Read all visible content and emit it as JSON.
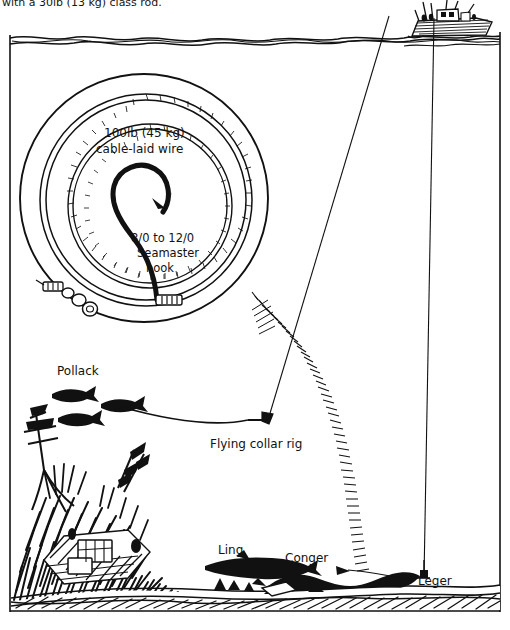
{
  "figure": {
    "domain": "Diagram",
    "title_fragment": "with a 30lb (13 kg) class rod.",
    "background_color": "#ffffff",
    "ink_color": "#111111",
    "width": 510,
    "height": 630
  },
  "inset": {
    "name": "coiled wire trace",
    "wire_label_line1": "100lb (45 kg)",
    "wire_label_line2": "cable-laid wire",
    "hook_label_line1": "8/0 to 12/0",
    "hook_label_line2": "Seamaster",
    "hook_label_line3": "hook",
    "components": [
      "outer-circle",
      "coiled-wire-spiral",
      "large-hook",
      "crimp-sleeve",
      "swivel-and-link"
    ]
  },
  "labels": {
    "pollack": "Pollack",
    "flying_collar_rig": "Flying collar rig",
    "ling": "Ling",
    "conger": "Conger",
    "leger": "Leger"
  },
  "scene": {
    "boat": "fishing-boat",
    "water_surface": "sea-surface-line",
    "seabed": "seabed",
    "wreck": "shipwreck",
    "kelp": "kelp-and-weed",
    "lines": [
      {
        "name": "flying-collar-line",
        "from": "boat",
        "to": "flying-collar-rig"
      },
      {
        "name": "leger-line",
        "from": "boat",
        "to": "leger-weight"
      }
    ],
    "fish": [
      {
        "species": "Pollack",
        "count": 3
      },
      {
        "species": "Ling",
        "count": 1
      },
      {
        "species": "Conger",
        "count": 1
      }
    ]
  }
}
